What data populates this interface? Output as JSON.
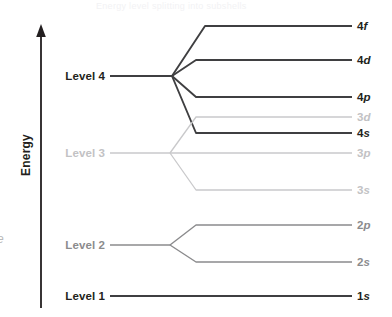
{
  "figure": {
    "title": "Energy level splitting into subshells",
    "axis_label": "Energy",
    "arrow_icon": "up-arrow-icon",
    "edge_glyph": "e"
  },
  "colors": {
    "dark": "#3f3f41",
    "mid": "#8b8b8d",
    "light": "#c9c9cb",
    "text_dark": "#231f20",
    "text_mid": "#8b8b8d",
    "text_light": "#c2c2c4",
    "axis": "#231f20",
    "background": "#ffffff"
  },
  "chart_data": {
    "type": "line",
    "title": "Energy level splitting into subshells",
    "xlabel": "",
    "ylabel": "Energy",
    "grid": false,
    "legend": "none",
    "axis_direction": "increasing upward",
    "levels": [
      {
        "id": "level-4",
        "label": "Level 4",
        "tone": "dark",
        "trunk_y": 76,
        "trunk_x_start": 110,
        "vertex_x": 172,
        "subshells": [
          {
            "id": "4f",
            "n": "4",
            "l": "f",
            "y": 26,
            "tone": "dark",
            "split_x": 205
          },
          {
            "id": "4d",
            "n": "4",
            "l": "d",
            "y": 60,
            "tone": "dark",
            "split_x": 196
          },
          {
            "id": "4p",
            "n": "4",
            "l": "p",
            "y": 97,
            "tone": "dark",
            "split_x": 196
          },
          {
            "id": "4s",
            "n": "4",
            "l": "s",
            "y": 133,
            "tone": "dark",
            "split_x": 196
          }
        ]
      },
      {
        "id": "level-3",
        "label": "Level 3",
        "tone": "light",
        "trunk_y": 153,
        "trunk_x_start": 110,
        "vertex_x": 170,
        "subshells": [
          {
            "id": "3d",
            "n": "3",
            "l": "d",
            "y": 117,
            "tone": "light",
            "split_x": 196
          },
          {
            "id": "3p",
            "n": "3",
            "l": "p",
            "y": 153,
            "tone": "light",
            "split_x": 196
          },
          {
            "id": "3s",
            "n": "3",
            "l": "s",
            "y": 190,
            "tone": "light",
            "split_x": 196
          }
        ]
      },
      {
        "id": "level-2",
        "label": "Level 2",
        "tone": "mid",
        "trunk_y": 245,
        "trunk_x_start": 110,
        "vertex_x": 170,
        "subshells": [
          {
            "id": "2p",
            "n": "2",
            "l": "p",
            "y": 225,
            "tone": "mid",
            "split_x": 196
          },
          {
            "id": "2s",
            "n": "2",
            "l": "s",
            "y": 262,
            "tone": "mid",
            "split_x": 196
          }
        ]
      },
      {
        "id": "level-1",
        "label": "Level 1",
        "tone": "dark",
        "trunk_y": 296,
        "trunk_x_start": 110,
        "vertex_x": 110,
        "subshells": [
          {
            "id": "1s",
            "n": "1",
            "l": "s",
            "y": 296,
            "tone": "dark",
            "split_x": 110
          }
        ]
      }
    ],
    "line_end_x": 352,
    "label_x": 357
  }
}
